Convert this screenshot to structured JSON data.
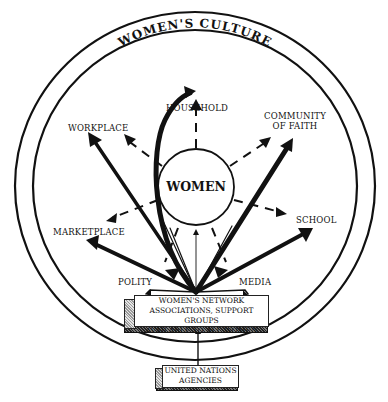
{
  "diagram": {
    "outer_ring_title": "WOMEN'S CULTURE",
    "center": "WOMEN",
    "domains": {
      "household": "HOUSEHOLD",
      "workplace": "WORKPLACE",
      "community_of_faith_line1": "COMMUNITY",
      "community_of_faith_line2": "OF FAITH",
      "marketplace": "MARKETPLACE",
      "school": "SCHOOL",
      "polity": "POLITY",
      "media": "MEDIA"
    },
    "network_box": {
      "line1": "WOMEN'S NETWORK",
      "line2": "ASSOCIATIONS, SUPPORT GROUPS",
      "line3": "AVAILABLE TO ALL WOMEN"
    },
    "un_box": {
      "line1": "UNITED NATIONS",
      "line2": "AGENCIES"
    },
    "colors": {
      "ink": "#111111",
      "background": "#ffffff"
    }
  }
}
